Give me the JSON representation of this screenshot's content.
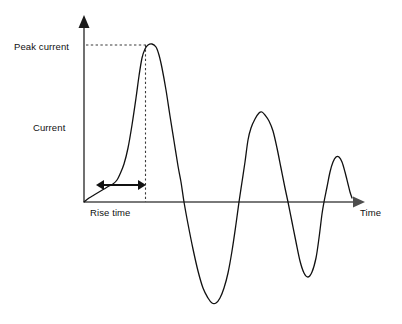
{
  "figure": {
    "title": "",
    "background_color": "#ffffff",
    "width": 402,
    "height": 324
  },
  "axes": {
    "y_axis": {
      "label": "Current",
      "arrow": "up-arrow-icon",
      "color": "#4d4d4d",
      "origin_x": 84,
      "top_y": 17,
      "bottom_y": 202
    },
    "x_axis": {
      "label": "Time",
      "arrow": "right-arrow-icon",
      "color": "#4d4d4d",
      "origin_y": 202,
      "left_x": 84,
      "right_x": 363
    }
  },
  "annotations": {
    "peak_current": {
      "label": "Peak current",
      "guide_style": "dashed",
      "guide_color": "#3a3a3a",
      "level_y": 45,
      "guide_from_x": 86,
      "guide_to_x": 145
    },
    "peak_marker": {
      "label": "",
      "guide_style": "dashed",
      "guide_color": "#3a3a3a",
      "x": 145,
      "from_y": 45,
      "to_y": 202
    },
    "rise_time": {
      "label": "Rise time",
      "marker": "double-headed-arrow-icon",
      "arrow_color": "#111111",
      "from_x": 98,
      "to_x": 145,
      "y": 185
    }
  },
  "chart_data": {
    "type": "line",
    "title": "",
    "xlabel": "Time",
    "ylabel": "Current",
    "grid": false,
    "legend": null,
    "series": [
      {
        "name": "Damped oscillating current waveform",
        "color": "#111111",
        "line_width": 1.3,
        "description": "Fast rise to peak current followed by damped oscillation decaying toward zero",
        "points_px": [
          [
            84,
            202
          ],
          [
            89,
            198
          ],
          [
            94,
            195
          ],
          [
            99,
            192
          ],
          [
            104,
            189
          ],
          [
            109,
            186
          ],
          [
            113,
            184
          ],
          [
            117,
            180
          ],
          [
            120,
            174
          ],
          [
            124,
            164
          ],
          [
            128,
            148
          ],
          [
            132,
            125
          ],
          [
            136,
            98
          ],
          [
            139,
            76
          ],
          [
            142,
            58
          ],
          [
            145,
            49
          ],
          [
            148,
            45
          ],
          [
            152,
            44
          ],
          [
            156,
            47
          ],
          [
            159,
            55
          ],
          [
            162,
            68
          ],
          [
            166,
            90
          ],
          [
            170,
            116
          ],
          [
            174,
            141
          ],
          [
            178,
            166
          ],
          [
            181,
            182
          ],
          [
            184,
            202
          ],
          [
            188,
            224
          ],
          [
            193,
            249
          ],
          [
            198,
            271
          ],
          [
            203,
            288
          ],
          [
            208,
            298
          ],
          [
            212,
            303
          ],
          [
            216,
            303
          ],
          [
            220,
            298
          ],
          [
            224,
            288
          ],
          [
            228,
            273
          ],
          [
            232,
            251
          ],
          [
            236,
            224
          ],
          [
            239,
            202
          ],
          [
            242,
            182
          ],
          [
            245,
            162
          ],
          [
            248,
            140
          ],
          [
            251,
            128
          ],
          [
            255,
            119
          ],
          [
            259,
            113
          ],
          [
            262,
            112
          ],
          [
            265,
            115
          ],
          [
            269,
            121
          ],
          [
            273,
            131
          ],
          [
            277,
            148
          ],
          [
            281,
            168
          ],
          [
            285,
            188
          ],
          [
            288,
            202
          ],
          [
            292,
            222
          ],
          [
            296,
            242
          ],
          [
            300,
            261
          ],
          [
            304,
            273
          ],
          [
            308,
            277
          ],
          [
            312,
            272
          ],
          [
            316,
            258
          ],
          [
            319,
            238
          ],
          [
            322,
            214
          ],
          [
            324,
            202
          ],
          [
            327,
            187
          ],
          [
            330,
            172
          ],
          [
            333,
            162
          ],
          [
            336,
            157
          ],
          [
            339,
            157
          ],
          [
            342,
            162
          ],
          [
            345,
            172
          ],
          [
            348,
            184
          ],
          [
            350,
            192
          ],
          [
            352,
            198
          ]
        ],
        "features": {
          "peak_current_px": [
            148,
            45
          ],
          "first_trough_px": [
            214,
            303
          ],
          "second_peak_px": [
            261,
            112
          ],
          "second_trough_px": [
            307,
            277
          ],
          "third_peak_px": [
            337,
            157
          ],
          "zero_crossings_px_x": [
            184,
            239,
            288,
            324
          ],
          "end_px": [
            352,
            198
          ]
        }
      }
    ]
  }
}
